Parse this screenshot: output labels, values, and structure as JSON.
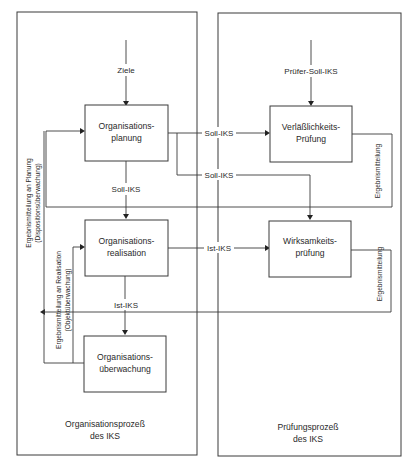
{
  "diagram": {
    "type": "flowchart",
    "colors": {
      "line": "#3a3a3a",
      "text": "#2a2a2a",
      "background": "#ffffff"
    },
    "containers": {
      "left": {
        "title_line1": "Organisationsprozeß",
        "title_line2": "des IKS"
      },
      "right": {
        "title_line1": "Prüfungsprozeß",
        "title_line2": "des IKS"
      }
    },
    "nodes": {
      "planung": {
        "line1": "Organisations-",
        "line2": "planung"
      },
      "realisation": {
        "line1": "Organisations-",
        "line2": "realisation"
      },
      "ueberwachung": {
        "line1": "Organisations-",
        "line2": "überwachung"
      },
      "verlaesslichkeit": {
        "line1": "Verläßlichkeits-",
        "line2": "Prüfung"
      },
      "wirksamkeit": {
        "line1": "Wirksamkeits-",
        "line2": "prüfung"
      }
    },
    "edge_labels": {
      "ziele": "Ziele",
      "pruefer_soll_iks": "Prüfer-Soll-IKS",
      "soll_iks_to_verl": "Soll-IKS",
      "soll_iks_to_wirk": "Soll-IKS",
      "soll_iks_down": "Soll-IKS",
      "ist_iks_to_wirk": "Ist-IKS",
      "ist_iks_down": "Ist-IKS",
      "ergebnis_verl": "Ergebnismitteilung",
      "ergebnis_wirk": "Ergebnismitteilung",
      "ergebnis_planung_line1": "Ergebnismitteilung an Planung",
      "ergebnis_planung_line2": "(Dispositionsüberwachung)",
      "ergebnis_realisation_line1": "Ergebnismitteilung an Realisation",
      "ergebnis_realisation_line2": "(Objektüberwachung)"
    }
  }
}
